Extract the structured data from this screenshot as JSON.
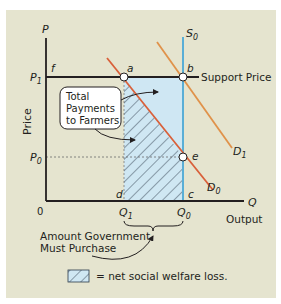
{
  "diagram": {
    "axes": {
      "y_axis_symbol": "P",
      "y_axis_label": "Price",
      "x_axis_symbol": "Q",
      "x_axis_label": "Output",
      "origin": "0"
    },
    "price_levels": {
      "p1": "P",
      "p1_sub": "1",
      "p0": "P",
      "p0_sub": "0",
      "support_price_label": "Support Price"
    },
    "quantities": {
      "q1": "Q",
      "q1_sub": "1",
      "q0": "Q",
      "q0_sub": "0"
    },
    "curves": {
      "s0": "S",
      "s0_sub": "0",
      "d0": "D",
      "d0_sub": "0",
      "d1": "D",
      "d1_sub": "1"
    },
    "points": {
      "a": "a",
      "b": "b",
      "c": "c",
      "d": "d",
      "e": "e",
      "f": "f"
    },
    "callouts": {
      "total_payments_line1": "Total",
      "total_payments_line2": "Payments",
      "total_payments_line3": "to Farmers",
      "govt_purchase_line1": "Amount Government",
      "govt_purchase_line2": "Must Purchase"
    },
    "legend": {
      "text": "= net social welfare loss."
    },
    "colors": {
      "background": "#e5e4cf",
      "shaded_region": "#cfe7f3",
      "supply_curve": "#5aaed6",
      "demand_d0": "#d9603a",
      "demand_d1": "#e0924a",
      "axis": "#231f20",
      "hatch": "#2b3a4a"
    }
  }
}
